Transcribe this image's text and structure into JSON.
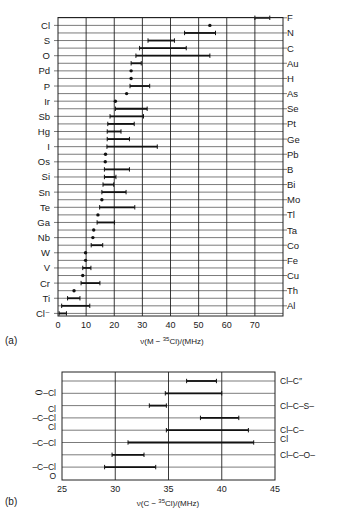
{
  "chart_data": [
    {
      "panel": "(a)",
      "type": "range-bar",
      "xlabel": "ν(M − ³⁵Cl)/(MHz)",
      "xlim": [
        0,
        80
      ],
      "xticks": [
        0,
        10,
        20,
        30,
        40,
        50,
        60,
        70
      ],
      "grid": true,
      "rows": [
        {
          "label": "F",
          "side": "right",
          "min": 70.0,
          "max": 75.3
        },
        {
          "label": "Cl",
          "side": "left",
          "min": 54.0,
          "max": 54.0
        },
        {
          "label": "N",
          "side": "right",
          "min": 45.0,
          "max": 56.0
        },
        {
          "label": "S",
          "side": "left",
          "min": 32.0,
          "max": 41.4
        },
        {
          "label": "C",
          "side": "right",
          "min": 29.0,
          "max": 45.6
        },
        {
          "label": "O",
          "side": "left",
          "min": 27.7,
          "max": 54.0
        },
        {
          "label": "Au",
          "side": "right",
          "min": 26.0,
          "max": 29.6
        },
        {
          "label": "Pd",
          "side": "left",
          "min": 26.0,
          "max": 26.0
        },
        {
          "label": "H",
          "side": "right",
          "min": 26.0,
          "max": 26.0
        },
        {
          "label": "P",
          "side": "left",
          "min": 25.6,
          "max": 32.6
        },
        {
          "label": "As",
          "side": "right",
          "min": 24.4,
          "max": 24.4
        },
        {
          "label": "Ir",
          "side": "left",
          "min": 20.4,
          "max": 20.4
        },
        {
          "label": "Se",
          "side": "right",
          "min": 20.4,
          "max": 31.7
        },
        {
          "label": "Sb",
          "side": "left",
          "min": 18.5,
          "max": 30.4
        },
        {
          "label": "Pt",
          "side": "right",
          "min": 17.7,
          "max": 27.1
        },
        {
          "label": "Hg",
          "side": "left",
          "min": 17.5,
          "max": 22.4
        },
        {
          "label": "Ge",
          "side": "right",
          "min": 17.5,
          "max": 25.4
        },
        {
          "label": "I",
          "side": "left",
          "min": 17.4,
          "max": 35.3
        },
        {
          "label": "Pb",
          "side": "right",
          "min": 16.9,
          "max": 16.9
        },
        {
          "label": "Os",
          "side": "left",
          "min": 16.8,
          "max": 16.8
        },
        {
          "label": "B",
          "side": "right",
          "min": 16.5,
          "max": 25.4
        },
        {
          "label": "Si",
          "side": "left",
          "min": 16.5,
          "max": 20.6
        },
        {
          "label": "Bi",
          "side": "right",
          "min": 16.0,
          "max": 19.8
        },
        {
          "label": "Sn",
          "side": "left",
          "min": 15.6,
          "max": 24.2
        },
        {
          "label": "Mo",
          "side": "right",
          "min": 15.6,
          "max": 15.6
        },
        {
          "label": "Te",
          "side": "left",
          "min": 14.8,
          "max": 27.3
        },
        {
          "label": "Tl",
          "side": "right",
          "min": 14.2,
          "max": 14.2
        },
        {
          "label": "Ga",
          "side": "left",
          "min": 13.9,
          "max": 20.1
        },
        {
          "label": "Ta",
          "side": "right",
          "min": 12.7,
          "max": 12.7
        },
        {
          "label": "Nb",
          "side": "left",
          "min": 12.4,
          "max": 12.4
        },
        {
          "label": "Co",
          "side": "right",
          "min": 11.8,
          "max": 15.9
        },
        {
          "label": "W",
          "side": "left",
          "min": 9.8,
          "max": 9.8
        },
        {
          "label": "Fe",
          "side": "right",
          "min": 9.8,
          "max": 9.8
        },
        {
          "label": "V",
          "side": "left",
          "min": 8.8,
          "max": 11.7
        },
        {
          "label": "Cu",
          "side": "right",
          "min": 8.8,
          "max": 8.8
        },
        {
          "label": "Cr",
          "side": "left",
          "min": 8.2,
          "max": 14.9
        },
        {
          "label": "Th",
          "side": "right",
          "min": 5.7,
          "max": 5.7
        },
        {
          "label": "Ti",
          "side": "left",
          "min": 3.4,
          "max": 7.8
        },
        {
          "label": "Al",
          "side": "right",
          "min": 1.3,
          "max": 11.3
        },
        {
          "label": "Cl⁻",
          "side": "left",
          "min": 0.4,
          "max": 3.0
        }
      ]
    },
    {
      "panel": "(b)",
      "type": "range-bar",
      "xlabel": "ν(C − ³⁵Cl)/(MHz)",
      "xlim": [
        25,
        45
      ],
      "xticks": [
        25,
        30,
        35,
        40,
        45
      ],
      "grid": true,
      "rows": [
        {
          "label": "Cl–C(=)",
          "side": "right",
          "min": 36.7,
          "max": 39.5
        },
        {
          "label": "(aryl)–Cl",
          "side": "left",
          "min": 34.7,
          "max": 40.0
        },
        {
          "label": "Cl–C–S–",
          "side": "right",
          "min": 33.2,
          "max": 34.8
        },
        {
          "label": "Cl–C–Cl (–C(Cl)–Cl)",
          "side": "left",
          "min": 38.0,
          "max": 41.6
        },
        {
          "label": "Cl–C–Cl",
          "side": "right",
          "min": 34.8,
          "max": 42.5
        },
        {
          "label": "–C–Cl",
          "side": "left",
          "min": 31.2,
          "max": 43.0
        },
        {
          "label": "Cl–C–O–",
          "side": "right",
          "min": 29.7,
          "max": 32.7
        },
        {
          "label": "–C(=O)–Cl",
          "side": "left",
          "min": 29.0,
          "max": 33.8
        }
      ]
    }
  ],
  "panel_a": {
    "label": "(a)",
    "xlabel_prefix": "ν(M − ",
    "xlabel_sup": "35",
    "xlabel_suffix": "Cl)/(MHz)"
  },
  "panel_b": {
    "label": "(b)",
    "xlabel_prefix": "ν(C − ",
    "xlabel_sup": "35",
    "xlabel_suffix": "Cl)/(MHz)",
    "left_labels": [
      {
        "lines": [
          "⬭–Cl"
        ],
        "row": 1
      },
      {
        "lines": [
          "Cl",
          "–C–Cl",
          "Cl"
        ],
        "row": 3
      },
      {
        "lines": [
          "–C–Cl"
        ],
        "row": 5
      },
      {
        "lines": [
          "–C–Cl",
          "O"
        ],
        "row": 7
      }
    ],
    "right_labels": [
      {
        "lines": [
          "Cl–C″"
        ],
        "row": 0
      },
      {
        "lines": [
          "Cl–C–S–"
        ],
        "row": 2
      },
      {
        "lines": [
          "Cl–C–",
          "Cl"
        ],
        "row": 4
      },
      {
        "lines": [
          "Cl–C–O–"
        ],
        "row": 6
      }
    ]
  },
  "colors": {
    "ink": "#111111",
    "background": "#ffffff"
  }
}
